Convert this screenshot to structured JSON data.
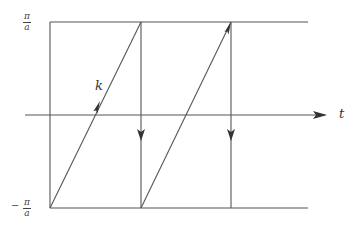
{
  "diagram": {
    "labels": {
      "upper_bound": {
        "numerator": "π",
        "denominator": "a",
        "sign": ""
      },
      "lower_bound": {
        "numerator": "π",
        "denominator": "a",
        "sign": "−"
      },
      "time_axis": "t",
      "wavevector": "k"
    },
    "geometry": {
      "k_max_y": 22,
      "k_min_y": 208,
      "axis_y": 115,
      "axis_x_start": 25,
      "axis_x_end": 327,
      "bounds_x_start": 50,
      "bounds_x_end": 308,
      "period_x": [
        50,
        141,
        231
      ]
    },
    "segments": [
      {
        "type": "ramp",
        "from": [
          50,
          208
        ],
        "to": [
          141,
          22
        ],
        "arrow": "mid"
      },
      {
        "type": "drop",
        "from": [
          141,
          22
        ],
        "to": [
          141,
          208
        ],
        "arrow": "mid"
      },
      {
        "type": "ramp",
        "from": [
          141,
          208
        ],
        "to": [
          231,
          22
        ],
        "arrow": "end"
      },
      {
        "type": "drop",
        "from": [
          231,
          22
        ],
        "to": [
          231,
          208
        ],
        "arrow": "mid"
      }
    ],
    "colors": {
      "line": "#555555",
      "text": "#333333"
    }
  }
}
